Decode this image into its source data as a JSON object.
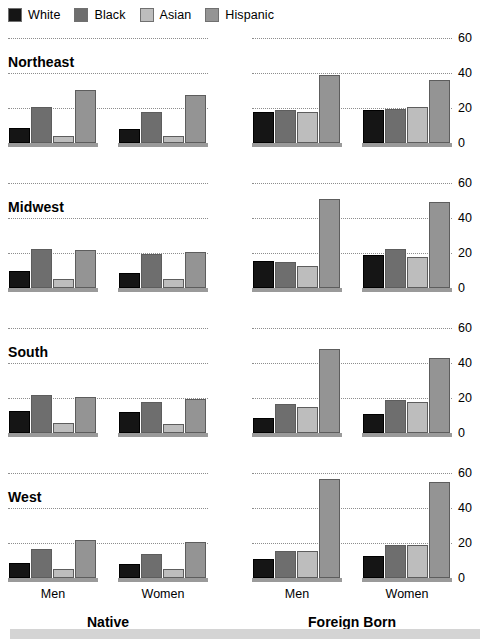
{
  "legend": {
    "items": [
      {
        "label": "White",
        "color": "#151515",
        "key": "white"
      },
      {
        "label": "Black",
        "color": "#6e6e6e",
        "key": "black"
      },
      {
        "label": "Asian",
        "color": "#bdbdbd",
        "key": "asian"
      },
      {
        "label": "Hispanic",
        "color": "#949494",
        "key": "hispanic"
      }
    ]
  },
  "axis": {
    "ticks": [
      "0",
      "20",
      "40",
      "60"
    ],
    "tick_values": [
      0,
      20,
      40,
      60
    ],
    "ylim": [
      0,
      66
    ]
  },
  "panel_labels": {
    "sex": [
      "Men",
      "Women"
    ],
    "nativity": [
      "Native",
      "Foreign Born"
    ]
  },
  "regions": [
    "Northeast",
    "Midwest",
    "South",
    "West"
  ],
  "chart_data": {
    "type": "bar",
    "title": "",
    "xlabel": "",
    "ylabel": "",
    "ylim": [
      0,
      66
    ],
    "grid": true,
    "gridlines": [
      20,
      40,
      60
    ],
    "legend_position": "top-left",
    "series": [
      {
        "name": "White",
        "color": "#151515"
      },
      {
        "name": "Black",
        "color": "#6e6e6e"
      },
      {
        "name": "Asian",
        "color": "#bdbdbd"
      },
      {
        "name": "Hispanic",
        "color": "#949494"
      }
    ],
    "facets": {
      "rows": [
        "Northeast",
        "Midwest",
        "South",
        "West"
      ],
      "cols": [
        "Native",
        "Foreign Born"
      ],
      "subgroups": [
        "Men",
        "Women"
      ]
    },
    "panels": [
      {
        "region": "Northeast",
        "nativity": "Native",
        "groups": [
          {
            "sex": "Men",
            "values": {
              "White": 9,
              "Black": 21,
              "Asian": 4,
              "Hispanic": 31
            }
          },
          {
            "sex": "Women",
            "values": {
              "White": 8,
              "Black": 18,
              "Asian": 4,
              "Hispanic": 28
            }
          }
        ]
      },
      {
        "region": "Northeast",
        "nativity": "Foreign Born",
        "groups": [
          {
            "sex": "Men",
            "values": {
              "White": 18,
              "Black": 19,
              "Asian": 18,
              "Hispanic": 40
            }
          },
          {
            "sex": "Women",
            "values": {
              "White": 19,
              "Black": 20,
              "Asian": 21,
              "Hispanic": 37
            }
          }
        ]
      },
      {
        "region": "Midwest",
        "nativity": "Native",
        "groups": [
          {
            "sex": "Men",
            "values": {
              "White": 10,
              "Black": 23,
              "Asian": 5,
              "Hispanic": 22
            }
          },
          {
            "sex": "Women",
            "values": {
              "White": 9,
              "Black": 20,
              "Asian": 5,
              "Hispanic": 21
            }
          }
        ]
      },
      {
        "region": "Midwest",
        "nativity": "Foreign Born",
        "groups": [
          {
            "sex": "Men",
            "values": {
              "White": 16,
              "Black": 15,
              "Asian": 13,
              "Hispanic": 52
            }
          },
          {
            "sex": "Women",
            "values": {
              "White": 19,
              "Black": 23,
              "Asian": 18,
              "Hispanic": 50
            }
          }
        ]
      },
      {
        "region": "South",
        "nativity": "Native",
        "groups": [
          {
            "sex": "Men",
            "values": {
              "White": 13,
              "Black": 22,
              "Asian": 6,
              "Hispanic": 21
            }
          },
          {
            "sex": "Women",
            "values": {
              "White": 12,
              "Black": 18,
              "Asian": 5,
              "Hispanic": 20
            }
          }
        ]
      },
      {
        "region": "South",
        "nativity": "Foreign Born",
        "groups": [
          {
            "sex": "Men",
            "values": {
              "White": 9,
              "Black": 17,
              "Asian": 15,
              "Hispanic": 49
            }
          },
          {
            "sex": "Women",
            "values": {
              "White": 11,
              "Black": 19,
              "Asian": 18,
              "Hispanic": 44
            }
          }
        ]
      },
      {
        "region": "West",
        "nativity": "Native",
        "groups": [
          {
            "sex": "Men",
            "values": {
              "White": 9,
              "Black": 17,
              "Asian": 5,
              "Hispanic": 22
            }
          },
          {
            "sex": "Women",
            "values": {
              "White": 8,
              "Black": 14,
              "Asian": 5,
              "Hispanic": 21
            }
          }
        ]
      },
      {
        "region": "West",
        "nativity": "Foreign Born",
        "groups": [
          {
            "sex": "Men",
            "values": {
              "White": 11,
              "Black": 16,
              "Asian": 16,
              "Hispanic": 58
            }
          },
          {
            "sex": "Women",
            "values": {
              "White": 13,
              "Black": 19,
              "Asian": 19,
              "Hispanic": 56
            }
          }
        ]
      }
    ]
  }
}
